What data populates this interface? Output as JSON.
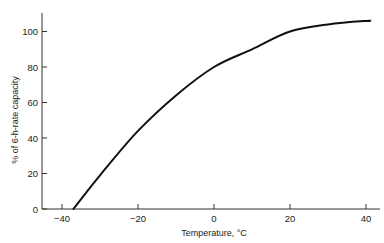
{
  "chart_data": {
    "type": "line",
    "title": "",
    "xlabel": "Temperature, °C",
    "ylabel": "% of 6-h-rate capacity",
    "xlim": [
      -45,
      43
    ],
    "ylim": [
      0,
      110
    ],
    "xticks": [
      -40,
      -20,
      0,
      20,
      40
    ],
    "xtick_labels": [
      "−40",
      "−20",
      "0",
      "20",
      "40"
    ],
    "yticks": [
      0,
      20,
      40,
      60,
      80,
      100
    ],
    "ytick_labels": [
      "0",
      "20",
      "40",
      "60",
      "80",
      "100"
    ],
    "grid": false,
    "legend": null,
    "series": [
      {
        "name": "capacity",
        "color": "#111111",
        "x": [
          -37,
          -30,
          -20,
          -10,
          0,
          10,
          20,
          30,
          40,
          41
        ],
        "y": [
          0,
          19,
          44,
          64,
          80,
          90,
          100,
          104,
          106,
          106
        ]
      }
    ]
  }
}
